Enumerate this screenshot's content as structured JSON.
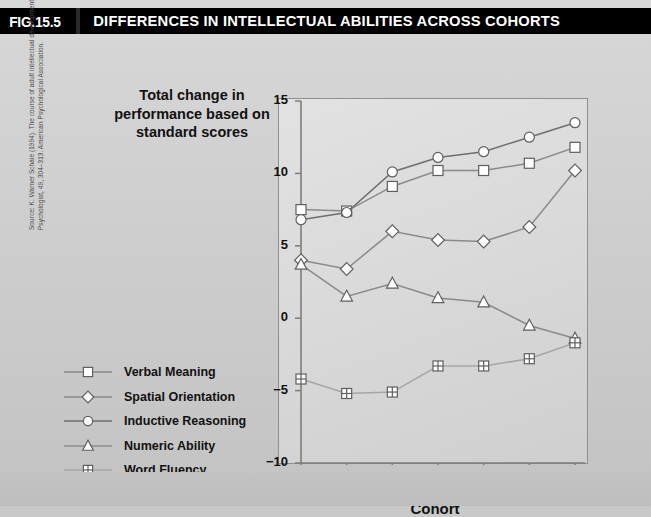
{
  "header": {
    "fig_tag": "FIG.15.5",
    "title": "DIFFERENCES IN INTELLECTUAL ABILITIES ACROSS COHORTS"
  },
  "source_note": "Source: K. Warner Schaie (1994). The course of adult intellectual development. American Psychologist, 49, 304–313. American Psychological Association.",
  "colors": {
    "header_bg": "#000000",
    "header_text": "#ffffff",
    "panel_bg": "#d2d2d2",
    "plot_bg": "#dcdcdc",
    "axis": "#7d7d7d",
    "series_dark": "#6e6e6e",
    "series_mid": "#8a8a8a",
    "series_light": "#a6a6a6"
  },
  "chart_data": {
    "type": "line",
    "title": "Total change in performance based on standard scores",
    "xlabel": "Cohort",
    "ylabel": "",
    "categories": [
      "1924",
      "1931",
      "1938",
      "1945",
      "1952",
      "1959",
      "1966"
    ],
    "x": [
      1924,
      1931,
      1938,
      1945,
      1952,
      1959,
      1966
    ],
    "ylim": [
      -10,
      15
    ],
    "yticks": [
      15,
      10,
      5,
      0,
      -5,
      -10
    ],
    "ytick_labels": [
      "15",
      "10",
      "5",
      "0",
      "−5",
      "−10"
    ],
    "grid": false,
    "legend_position": "left-outside",
    "series": [
      {
        "name": "Verbal Meaning",
        "marker": "square",
        "values": [
          7.5,
          7.4,
          9.1,
          10.2,
          10.2,
          10.7,
          11.8
        ]
      },
      {
        "name": "Spatial Orientation",
        "marker": "diamond",
        "values": [
          4.0,
          3.4,
          6.0,
          5.4,
          5.3,
          6.3,
          10.2
        ]
      },
      {
        "name": "Inductive Reasoning",
        "marker": "circle",
        "values": [
          6.8,
          7.3,
          10.1,
          11.1,
          11.5,
          12.5,
          13.5
        ]
      },
      {
        "name": "Numeric Ability",
        "marker": "triangle",
        "values": [
          3.7,
          1.5,
          2.4,
          1.4,
          1.1,
          -0.5,
          -1.4
        ]
      },
      {
        "name": "Word Fluency",
        "marker": "crossed-square",
        "values": [
          -4.2,
          -5.2,
          -5.1,
          -3.3,
          -3.3,
          -2.8,
          -1.7
        ]
      }
    ]
  }
}
